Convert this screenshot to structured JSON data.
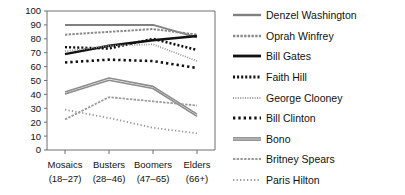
{
  "chart_data": {
    "type": "line",
    "title": "",
    "xlabel": "",
    "ylabel": "",
    "ylim": [
      0,
      100
    ],
    "ytick_step": 10,
    "yticks": [
      "0",
      "10",
      "20",
      "30",
      "40",
      "50",
      "60",
      "70",
      "80",
      "90",
      "100"
    ],
    "grid": false,
    "legend_position": "right",
    "categories": [
      "Mosaics",
      "Busters",
      "Boomers",
      "Elders"
    ],
    "category_sublabels": [
      "(18–27)",
      "(28–46)",
      "(47–65)",
      "(66+)"
    ],
    "series": [
      {
        "name": "Denzel Washington",
        "values": [
          90,
          90,
          90,
          81
        ],
        "color": "#808080",
        "style": "solid",
        "width": 2.0
      },
      {
        "name": "Oprah Winfrey",
        "values": [
          83,
          85,
          87,
          83
        ],
        "color": "#8a8a8a",
        "style": "fine-dash",
        "width": 2.0
      },
      {
        "name": "Bill Gates",
        "values": [
          69,
          75,
          79,
          82
        ],
        "color": "#111111",
        "style": "solid",
        "width": 2.4
      },
      {
        "name": "Faith Hill",
        "values": [
          74,
          73,
          80,
          72
        ],
        "color": "#111111",
        "style": "dotted",
        "width": 2.4
      },
      {
        "name": "George Clooney",
        "values": [
          71,
          75,
          76,
          64
        ],
        "color": "#9a9a9a",
        "style": "fine-dot",
        "width": 1.8
      },
      {
        "name": "Bill Clinton",
        "values": [
          63,
          65,
          64,
          59
        ],
        "color": "#111111",
        "style": "square-dot",
        "width": 2.6
      },
      {
        "name": "Bono",
        "values": [
          41,
          51,
          45,
          25
        ],
        "color": "#8c8c8c",
        "style": "double",
        "width": 1.6
      },
      {
        "name": "Britney Spears",
        "values": [
          22,
          38,
          35,
          32
        ],
        "color": "#9a9a9a",
        "style": "fine-dash",
        "width": 1.8
      },
      {
        "name": "Paris Hilton",
        "values": [
          29,
          23,
          16,
          12
        ],
        "color": "#9a9a9a",
        "style": "loose-dot",
        "width": 1.8
      }
    ]
  },
  "legend": {
    "items": [
      {
        "label": "Denzel Washington"
      },
      {
        "label": "Oprah Winfrey"
      },
      {
        "label": "Bill Gates"
      },
      {
        "label": "Faith Hill"
      },
      {
        "label": "George Clooney"
      },
      {
        "label": "Bill Clinton"
      },
      {
        "label": "Bono"
      },
      {
        "label": "Britney Spears"
      },
      {
        "label": "Paris Hilton"
      }
    ]
  }
}
